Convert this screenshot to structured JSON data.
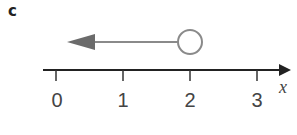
{
  "part_label": "c",
  "number_line": {
    "variable": "x",
    "ticks": [
      {
        "label": "0",
        "x": 56
      },
      {
        "label": "1",
        "x": 123
      },
      {
        "label": "2",
        "x": 190
      },
      {
        "label": "3",
        "x": 257
      }
    ],
    "axis_y": 70,
    "axis_x_start": 43,
    "axis_x_end": 291
  },
  "inequality": {
    "expression": "x < 2",
    "endpoint": 2,
    "endpoint_style": "open-circle",
    "direction": "left",
    "line_color": "#888888",
    "arrowhead_color": "#6b6b6b"
  }
}
